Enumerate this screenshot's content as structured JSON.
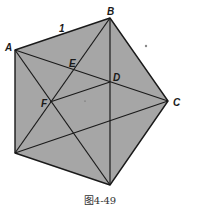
{
  "figure": {
    "caption": "图4-49",
    "side_label": "1",
    "fill_color": "#a6a6a6",
    "stroke_color": "#1a1a1a",
    "points": {
      "A": {
        "label": "A",
        "x": 15,
        "y": 50
      },
      "B": {
        "label": "B",
        "x": 110,
        "y": 18
      },
      "C": {
        "label": "C",
        "x": 168,
        "y": 101
      },
      "G": {
        "label": "",
        "x": 110,
        "y": 185
      },
      "H": {
        "label": "",
        "x": 15,
        "y": 153
      },
      "D": {
        "label": "D",
        "x": 110,
        "y": 82
      },
      "E": {
        "label": "E",
        "x": 73,
        "y": 69
      },
      "F": {
        "label": "F",
        "x": 50,
        "y": 102
      }
    },
    "segments": [
      [
        "A",
        "B"
      ],
      [
        "B",
        "C"
      ],
      [
        "C",
        "G"
      ],
      [
        "G",
        "H"
      ],
      [
        "H",
        "A"
      ],
      [
        "A",
        "C"
      ],
      [
        "A",
        "G"
      ],
      [
        "B",
        "H"
      ],
      [
        "B",
        "G"
      ],
      [
        "C",
        "H"
      ],
      [
        "F",
        "D"
      ]
    ]
  }
}
